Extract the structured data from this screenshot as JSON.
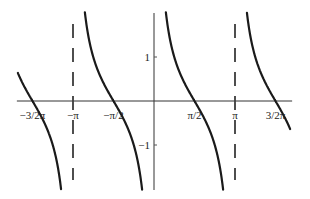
{
  "chart_data": {
    "type": "line",
    "title": "",
    "function": "cot(x)",
    "xlabel": "",
    "ylabel": "",
    "xlim": [
      -5.28,
      5.28
    ],
    "ylim": [
      -2.02,
      2.02
    ],
    "grid": false,
    "legend": "none",
    "x_ticks": [
      {
        "value": -4.712389,
        "label": "−3/2π"
      },
      {
        "value": -3.141593,
        "label": "−π"
      },
      {
        "value": -1.570796,
        "label": "−π/2"
      },
      {
        "value": 1.570796,
        "label": "π/2"
      },
      {
        "value": 3.141593,
        "label": "π"
      },
      {
        "value": 4.712389,
        "label": "3/2π"
      }
    ],
    "y_ticks": [
      {
        "value": 1,
        "label": "1"
      },
      {
        "value": -1,
        "label": "−1"
      }
    ],
    "asymptotes": [
      -3.141593,
      3.141593
    ],
    "series": [
      {
        "name": "cot(x) branch (-2π, -π)",
        "domain": [
          -6.283185,
          -3.141593
        ]
      },
      {
        "name": "cot(x) branch (-π, 0)",
        "domain": [
          -3.141593,
          0
        ]
      },
      {
        "name": "cot(x) branch (0, π)",
        "domain": [
          0,
          3.141593
        ]
      },
      {
        "name": "cot(x) branch (π, 2π)",
        "domain": [
          3.141593,
          6.283185
        ]
      }
    ]
  }
}
